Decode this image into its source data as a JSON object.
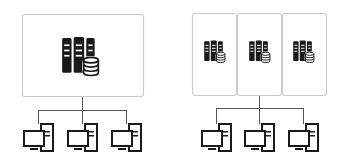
{
  "diagram": {
    "title": "",
    "colors": {
      "icon": "#1a1a1a",
      "box_border": "#c9c9c9",
      "connector": "#555555",
      "background": "#ffffff"
    },
    "left_group": {
      "description": "single server box connected to three clients",
      "server_boxes": [
        {
          "icon": "server-database-icon"
        }
      ],
      "clients": [
        {
          "icon": "desktop-computer-icon"
        },
        {
          "icon": "desktop-computer-icon"
        },
        {
          "icon": "desktop-computer-icon"
        }
      ]
    },
    "right_group": {
      "description": "three server boxes connected to three clients",
      "server_boxes": [
        {
          "icon": "server-database-icon"
        },
        {
          "icon": "server-database-icon"
        },
        {
          "icon": "server-database-icon"
        }
      ],
      "clients": [
        {
          "icon": "desktop-computer-icon"
        },
        {
          "icon": "desktop-computer-icon"
        },
        {
          "icon": "desktop-computer-icon"
        }
      ]
    }
  }
}
